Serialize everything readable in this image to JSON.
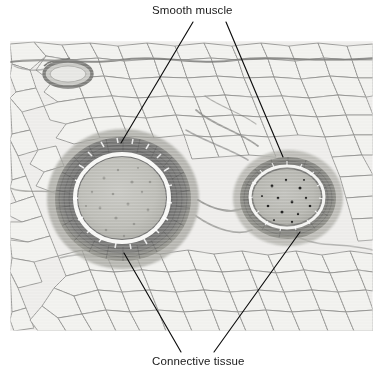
{
  "figure": {
    "kind": "light-microscopy-histology",
    "specimen": "artery and vein in adipose tissue",
    "stain_tone": "grayscale-hematoxylin-eosin",
    "micrograph": {
      "x": 10,
      "y": 41,
      "width": 363,
      "height": 290,
      "background_color": "#ededea",
      "cell_border_color": "#9a9a98"
    },
    "labels": [
      {
        "id": "smooth-muscle",
        "text": "Smooth muscle",
        "position": "top",
        "text_x": 152,
        "text_y": 4,
        "leaders": [
          {
            "x1": 193,
            "y1": 22,
            "x2": 121,
            "y2": 143
          },
          {
            "x1": 226,
            "y1": 22,
            "x2": 283,
            "y2": 157
          }
        ]
      },
      {
        "id": "connective-tissue",
        "text": "Connective tissue",
        "position": "bottom",
        "text_x": 152,
        "text_y": 355,
        "leaders": [
          {
            "x1": 181,
            "y1": 352,
            "x2": 124,
            "y2": 253
          },
          {
            "x1": 214,
            "y1": 352,
            "x2": 300,
            "y2": 232
          }
        ]
      }
    ],
    "structures": [
      {
        "name": "artery",
        "role": "large vessel, left of center",
        "cx": 123,
        "cy": 199,
        "wall_rx": 68,
        "wall_ry": 62,
        "lumen_rx": 44,
        "lumen_ry": 41,
        "wall_color": "#6d6d6d",
        "lumen_color": "#bcbcb8",
        "intima_color": "#f4f4f2"
      },
      {
        "name": "vein",
        "role": "smaller vessel, right of center",
        "cx": 288,
        "cy": 198,
        "wall_rx": 48,
        "wall_ry": 41,
        "lumen_rx": 34,
        "lumen_ry": 28,
        "wall_color": "#767675",
        "lumen_color": "#b6b6b2",
        "intima_color": "#f2f2f0"
      },
      {
        "name": "small-vessel",
        "role": "small vessel, upper left",
        "cx": 68,
        "cy": 74,
        "wall_rx": 22,
        "wall_ry": 11,
        "wall_color": "#8a8a88",
        "lumen_color": "#dedede"
      }
    ],
    "tissue": {
      "adipose_label": "adipose cells",
      "adipose_cell_fill": "#eeeeeb",
      "septa_color": "#8f8f8d",
      "leader_line_color": "#0d0d0d",
      "leader_line_width": 1.15
    }
  }
}
